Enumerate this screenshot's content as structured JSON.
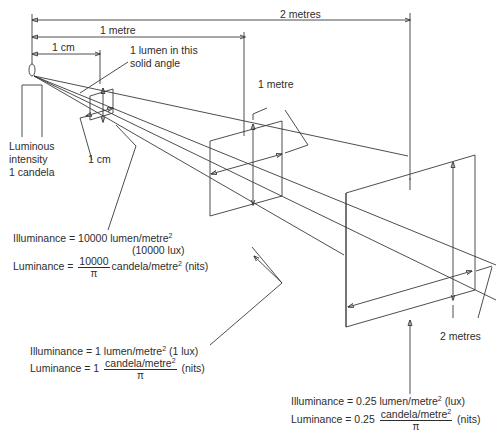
{
  "diagram": {
    "dimensions": {
      "two_metres_top": "2 metres",
      "one_metre_top": "1 metre",
      "one_cm_top": "1 cm",
      "one_cm_bottom": "1 cm",
      "one_metre_square": "1 metre",
      "two_metres_square": "2 metres"
    },
    "source": {
      "line1": "Luminous",
      "line2": "intensity",
      "line3": "1 candela"
    },
    "solid_angle": {
      "line1": "1 lumen in this",
      "line2": "solid angle"
    },
    "near": {
      "illum_prefix": "Illuminance = 10000 lumen/metre",
      "illum_sup": "2",
      "illum_lux": "(10000 lux)",
      "lum_prefix": "Luminance =",
      "lum_num": "10000",
      "lum_den": "π",
      "lum_suffix": "candela/metre",
      "lum_sup": "2",
      "lum_unit": "(nits)"
    },
    "mid": {
      "illum_prefix": "Illuminance = 1 lumen/metre",
      "illum_sup": "2",
      "illum_lux": "(1 lux)",
      "lum_prefix": "Luminance = 1",
      "lum_num": "candela/metre",
      "lum_num_sup": "2",
      "lum_den": "π",
      "lum_unit": "(nits)"
    },
    "far": {
      "illum_prefix": "Illuminance = 0.25 lumen/metre",
      "illum_sup": "2",
      "illum_lux": "(lux)",
      "lum_prefix": "Luminance = 0.25",
      "lum_num": "candela/metre",
      "lum_num_sup": "2",
      "lum_den": "π",
      "lum_unit": "(nits)"
    },
    "colors": {
      "line": "#3a3a3a",
      "text": "#2d2d2d",
      "background": "#ffffff"
    }
  }
}
